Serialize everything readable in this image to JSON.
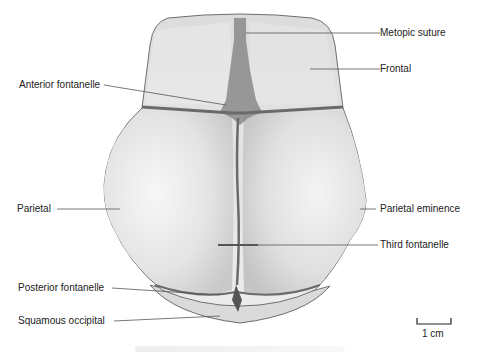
{
  "figure": {
    "labels": {
      "metopic_suture": "Metopic suture",
      "frontal": "Frontal",
      "anterior_fontanelle": "Anterior fontanelle",
      "parietal": "Parietal",
      "parietal_eminence": "Parietal eminence",
      "third_fontanelle": "Third fontanelle",
      "posterior_fontanelle": "Posterior fontanelle",
      "squamous_occipital": "Squamous occipital"
    },
    "scale_bar": {
      "label": "1 cm"
    },
    "colors": {
      "bone_fill": "#e6e6e6",
      "bone_outline": "#6f6f6f",
      "suture": "#6a6a6a",
      "fontanelle": "#8a8a8a",
      "leader_line": "#555555",
      "label_text": "#222222"
    }
  }
}
